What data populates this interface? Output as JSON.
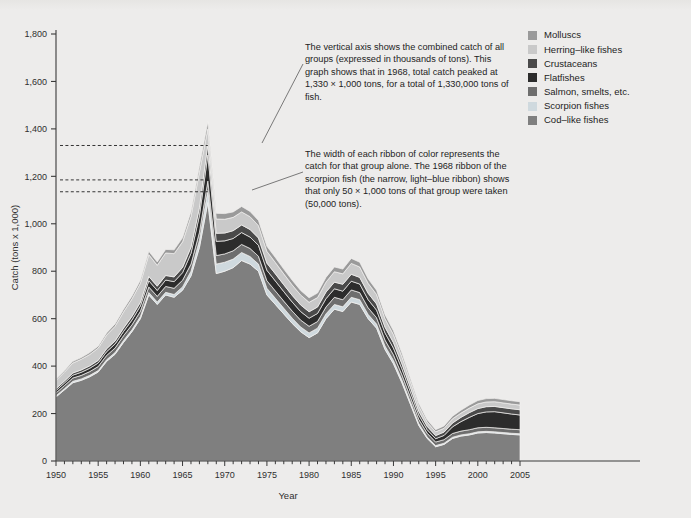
{
  "chart_data": {
    "type": "area",
    "xlabel": "Year",
    "ylabel": "Catch (tons x 1,000)",
    "xlim": [
      1950,
      2005
    ],
    "ylim": [
      0,
      1800
    ],
    "ytick_step": 200,
    "yticks": [
      "0",
      "200",
      "400",
      "600",
      "800",
      "1,000",
      "1,200",
      "1,400",
      "1,600",
      "1,800"
    ],
    "xticks": [
      "1950",
      "1955",
      "1960",
      "1965",
      "1970",
      "1975",
      "1980",
      "1985",
      "1990",
      "1995",
      "2000",
      "2005"
    ],
    "xminor_step": 1,
    "grid": false,
    "legend_position": "top-right",
    "stacked": true,
    "x": [
      1950,
      1951,
      1952,
      1953,
      1954,
      1955,
      1956,
      1957,
      1958,
      1959,
      1960,
      1961,
      1962,
      1963,
      1964,
      1965,
      1966,
      1967,
      1968,
      1969,
      1970,
      1971,
      1972,
      1973,
      1974,
      1975,
      1976,
      1977,
      1978,
      1979,
      1980,
      1981,
      1982,
      1983,
      1984,
      1985,
      1986,
      1987,
      1988,
      1989,
      1990,
      1991,
      1992,
      1993,
      1994,
      1995,
      1996,
      1997,
      1998,
      1999,
      2000,
      2001,
      2002,
      2003,
      2004,
      2005
    ],
    "series": [
      {
        "name": "Cod-like fishes",
        "color": "#7f7f7f",
        "values": [
          270,
          300,
          330,
          340,
          355,
          375,
          420,
          450,
          500,
          545,
          600,
          700,
          660,
          700,
          690,
          720,
          780,
          900,
          1090,
          790,
          800,
          815,
          845,
          830,
          800,
          700,
          660,
          620,
          580,
          545,
          520,
          540,
          600,
          640,
          630,
          670,
          660,
          600,
          560,
          470,
          410,
          330,
          240,
          150,
          95,
          60,
          70,
          95,
          105,
          110,
          118,
          120,
          118,
          115,
          112,
          110
        ]
      },
      {
        "name": "Scorpion fishes",
        "color": "#cfd9de",
        "values": [
          5,
          5,
          6,
          6,
          6,
          6,
          7,
          7,
          8,
          8,
          9,
          10,
          10,
          11,
          12,
          14,
          20,
          30,
          50,
          40,
          38,
          36,
          34,
          32,
          30,
          28,
          26,
          24,
          22,
          20,
          20,
          20,
          20,
          20,
          20,
          20,
          20,
          18,
          17,
          15,
          14,
          12,
          10,
          8,
          6,
          5,
          5,
          5,
          5,
          5,
          5,
          5,
          5,
          5,
          5,
          5
        ]
      },
      {
        "name": "Salmon, smelts, etc.",
        "color": "#6e6e6e",
        "values": [
          12,
          13,
          14,
          15,
          16,
          17,
          18,
          19,
          20,
          21,
          22,
          24,
          24,
          25,
          26,
          28,
          30,
          34,
          40,
          36,
          35,
          35,
          34,
          34,
          33,
          32,
          31,
          30,
          30,
          29,
          28,
          28,
          29,
          30,
          30,
          31,
          30,
          28,
          27,
          25,
          24,
          22,
          20,
          18,
          16,
          15,
          15,
          16,
          16,
          17,
          17,
          17,
          17,
          17,
          17,
          17
        ]
      },
      {
        "name": "Flatfishes",
        "color": "#2c2c2c",
        "values": [
          10,
          11,
          12,
          13,
          14,
          15,
          16,
          17,
          18,
          20,
          22,
          26,
          25,
          27,
          28,
          32,
          45,
          70,
          110,
          60,
          55,
          52,
          50,
          48,
          46,
          44,
          42,
          40,
          38,
          36,
          34,
          34,
          35,
          36,
          36,
          37,
          36,
          34,
          32,
          30,
          28,
          25,
          22,
          18,
          15,
          14,
          18,
          28,
          40,
          52,
          60,
          65,
          68,
          66,
          64,
          62
        ]
      },
      {
        "name": "Crustaceans",
        "color": "#4a4a4a",
        "values": [
          8,
          8,
          9,
          10,
          10,
          11,
          12,
          13,
          14,
          15,
          16,
          18,
          18,
          19,
          20,
          22,
          26,
          34,
          45,
          34,
          33,
          33,
          32,
          32,
          31,
          30,
          30,
          29,
          28,
          28,
          27,
          27,
          28,
          28,
          29,
          29,
          28,
          27,
          26,
          24,
          23,
          21,
          19,
          16,
          14,
          13,
          14,
          16,
          18,
          20,
          21,
          22,
          22,
          22,
          22,
          22
        ]
      },
      {
        "name": "Herring-like fishes",
        "color": "#c9c9c9",
        "values": [
          35,
          38,
          42,
          45,
          48,
          52,
          58,
          62,
          68,
          74,
          80,
          92,
          88,
          95,
          98,
          108,
          130,
          150,
          65,
          60,
          58,
          56,
          55,
          54,
          52,
          50,
          48,
          46,
          44,
          42,
          40,
          40,
          42,
          44,
          44,
          46,
          44,
          42,
          40,
          36,
          34,
          30,
          26,
          22,
          18,
          16,
          16,
          18,
          18,
          19,
          20,
          20,
          20,
          20,
          20,
          20
        ]
      },
      {
        "name": "Molluscs",
        "color": "#9a9a9a",
        "values": [
          6,
          6,
          7,
          7,
          8,
          8,
          9,
          10,
          11,
          12,
          13,
          14,
          14,
          15,
          16,
          17,
          20,
          24,
          30,
          24,
          24,
          23,
          23,
          22,
          22,
          21,
          21,
          20,
          20,
          19,
          19,
          19,
          20,
          20,
          20,
          21,
          20,
          19,
          18,
          17,
          16,
          15,
          13,
          11,
          10,
          9,
          10,
          11,
          12,
          13,
          14,
          14,
          14,
          14,
          14,
          14
        ]
      }
    ],
    "reference_lines": [
      {
        "value": 1330,
        "label": "1968 total catch"
      },
      {
        "value": 1185,
        "label": "top of scorpion fish ribbon 1968"
      },
      {
        "value": 1135,
        "label": "bottom of scorpion fish ribbon 1968"
      }
    ]
  },
  "legend": {
    "items": [
      {
        "label": "Molluscs",
        "color": "#9a9a9a"
      },
      {
        "label": "Herring–like fishes",
        "color": "#c9c9c9"
      },
      {
        "label": "Crustaceans",
        "color": "#4a4a4a"
      },
      {
        "label": "Flatfishes",
        "color": "#2c2c2c"
      },
      {
        "label": "Salmon, smelts, etc.",
        "color": "#6e6e6e"
      },
      {
        "label": "Scorpion fishes",
        "color": "#cfd9de"
      },
      {
        "label": "Cod–like fishes",
        "color": "#7f7f7f"
      }
    ]
  },
  "annotations": {
    "first": "The vertical axis shows the combined catch of all groups (expressed in thousands of tons). This graph shows that in 1968, total catch peaked at 1,330 × 1,000 tons, for a total of 1,330,000 tons of fish.",
    "second": "The width of each ribbon of color represents the catch for that group alone. The 1968 ribbon of the scorpion fish (the narrow, light–blue ribbon) shows that only 50 × 1,000 tons of that group were taken (50,000 tons)."
  },
  "colors": {
    "background": "#edeceb",
    "axis": "#3a3a3a",
    "text": "#232323"
  }
}
